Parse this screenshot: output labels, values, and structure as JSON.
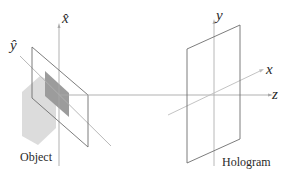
{
  "labels": {
    "object_x_axis": "x̂",
    "object_y_axis": "ŷ",
    "hologram_y_axis": "y",
    "hologram_x_axis": "x",
    "z_axis": "z",
    "object_caption": "Object",
    "hologram_caption": "Hologram"
  },
  "colors": {
    "line": "#8a8a8a",
    "frame": "#6e6e6e",
    "axis_light": "#b8b8b8",
    "cube_light": "#d8d8d8",
    "cube_dark": "#9a9a9a",
    "text": "#2a2a2a"
  }
}
